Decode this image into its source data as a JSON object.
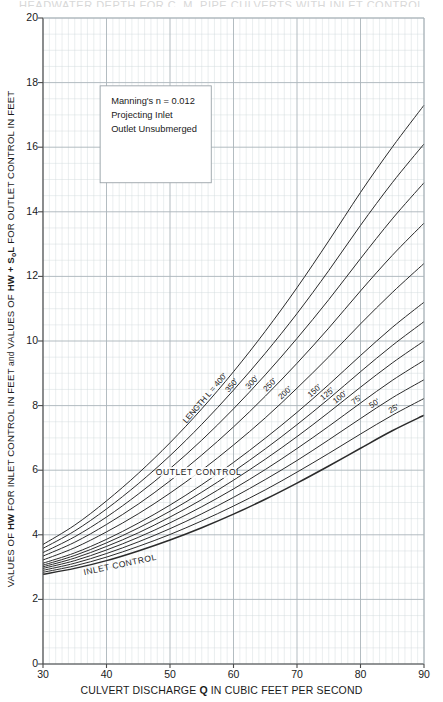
{
  "title_cut_off": "HEADWATER DEPTH FOR C. M. PIPE CULVERTS WITH INLET CONTROL",
  "axes": {
    "x_label_prefix": "CULVERT DISCHARGE ",
    "x_label_symbol": "Q",
    "x_label_suffix": " IN CUBIC FEET PER SECOND",
    "y_label_part1": "VALUES OF ",
    "y_label_hw1": "HW",
    "y_label_part2": " FOR INLET CONTROL IN FEET ",
    "y_label_and": "and",
    "y_label_part3": " VALUES OF ",
    "y_label_hw2": "HW",
    "y_label_plus": " + S",
    "y_label_sub": "o",
    "y_label_L": "L",
    "y_label_part4": " FOR OUTLET CONTROL IN FEET",
    "x_ticks": [
      30,
      40,
      50,
      60,
      70,
      80,
      90
    ],
    "y_ticks": [
      0,
      2,
      4,
      6,
      8,
      10,
      12,
      14,
      16,
      18,
      20
    ],
    "xlim": [
      30,
      90
    ],
    "ylim": [
      0,
      20
    ],
    "grid": "minor-and-major"
  },
  "legend_box": {
    "line1": "Manning's n = 0.012",
    "line2": "Projecting Inlet",
    "line3": "Outlet Unsubmerged"
  },
  "annotations": {
    "outlet_control": "OUTLET CONTROL",
    "inlet_control": "INLET CONTROL",
    "length_prefix": "LENGTH L = 400'"
  },
  "colors": {
    "curve": "#2b2b2b",
    "grid_minor": "#cfd8dc",
    "grid_major": "#aab4ba",
    "axis": "#4a4a4a",
    "text": "#1a1a1a",
    "box_border": "#9aa3a8"
  },
  "chart_data": {
    "type": "line",
    "title": "HEADWATER DEPTH FOR C. M. PIPE CULVERTS WITH INLET CONTROL",
    "xlabel": "CULVERT DISCHARGE Q IN CUBIC FEET PER SECOND",
    "ylabel": "VALUES OF HW FOR INLET CONTROL IN FEET and VALUES OF HW + SoL FOR OUTLET CONTROL IN FEET",
    "xlim": [
      30,
      90
    ],
    "ylim": [
      0,
      20
    ],
    "xticks": [
      30,
      40,
      50,
      60,
      70,
      80,
      90
    ],
    "yticks": [
      0,
      2,
      4,
      6,
      8,
      10,
      12,
      14,
      16,
      18,
      20
    ],
    "grid": true,
    "legend_position": "inline-curve-labels",
    "x": [
      30,
      35,
      40,
      45,
      50,
      55,
      60,
      65,
      70,
      75,
      80,
      85,
      90
    ],
    "series": [
      {
        "name": "LENGTH L = 400'",
        "label": "LENGTH L = 400'",
        "values": [
          3.7,
          4.3,
          5.05,
          5.9,
          6.85,
          7.9,
          9.05,
          10.3,
          11.65,
          13.1,
          14.6,
          16.0,
          17.3
        ]
      },
      {
        "name": "350'",
        "label": "350'",
        "values": [
          3.58,
          4.12,
          4.8,
          5.58,
          6.45,
          7.42,
          8.48,
          9.62,
          10.85,
          12.18,
          13.58,
          14.9,
          16.1
        ]
      },
      {
        "name": "300'",
        "label": "300'",
        "values": [
          3.45,
          3.94,
          4.55,
          5.26,
          6.05,
          6.93,
          7.9,
          8.95,
          10.08,
          11.28,
          12.55,
          13.78,
          14.9
        ]
      },
      {
        "name": "250'",
        "label": "250'",
        "values": [
          3.34,
          3.77,
          4.32,
          4.95,
          5.67,
          6.47,
          7.34,
          8.29,
          9.31,
          10.4,
          11.55,
          12.65,
          13.65
        ]
      },
      {
        "name": "200'",
        "label": "200'",
        "values": [
          3.22,
          3.6,
          4.09,
          4.65,
          5.29,
          6.0,
          6.78,
          7.62,
          8.54,
          9.51,
          10.53,
          11.5,
          12.4
        ]
      },
      {
        "name": "150'",
        "label": "150'",
        "values": [
          3.12,
          3.44,
          3.86,
          4.36,
          4.92,
          5.55,
          6.24,
          6.99,
          7.79,
          8.65,
          9.55,
          10.42,
          11.2
        ]
      },
      {
        "name": "125'",
        "label": "125'",
        "values": [
          3.06,
          3.36,
          3.75,
          4.21,
          4.73,
          5.32,
          5.96,
          6.66,
          7.41,
          8.21,
          9.05,
          9.86,
          10.6
        ]
      },
      {
        "name": "100'",
        "label": "100'",
        "values": [
          3.01,
          3.28,
          3.64,
          4.06,
          4.55,
          5.09,
          5.69,
          6.34,
          7.04,
          7.79,
          8.57,
          9.32,
          10.0
        ]
      },
      {
        "name": "75'",
        "label": "75'",
        "values": [
          2.96,
          3.2,
          3.53,
          3.92,
          4.37,
          4.87,
          5.42,
          6.02,
          6.67,
          7.36,
          8.08,
          8.78,
          9.4
        ]
      },
      {
        "name": "50'",
        "label": "50'",
        "values": [
          2.9,
          3.12,
          3.42,
          3.78,
          4.19,
          4.65,
          5.16,
          5.71,
          6.3,
          6.94,
          7.6,
          8.24,
          8.8
        ]
      },
      {
        "name": "25'",
        "label": "25'",
        "values": [
          2.84,
          3.04,
          3.31,
          3.64,
          4.01,
          4.43,
          4.89,
          5.39,
          5.94,
          6.52,
          7.12,
          7.7,
          8.22
        ]
      },
      {
        "name": "INLET CONTROL",
        "label": "INLET CONTROL",
        "values": [
          2.78,
          2.96,
          3.2,
          3.5,
          3.84,
          4.22,
          4.64,
          5.1,
          5.6,
          6.13,
          6.68,
          7.22,
          7.7
        ]
      }
    ],
    "annotations": [
      {
        "text": "OUTLET CONTROL",
        "x": 54.5,
        "y": 5.85
      },
      {
        "text": "INLET CONTROL",
        "x": 36.5,
        "y": 2.75
      },
      {
        "text": "Manning's n = 0.012",
        "x": 40.5,
        "y": 17.1
      },
      {
        "text": "Projecting Inlet",
        "x": 40.5,
        "y": 16.3
      },
      {
        "text": "Outlet Unsubmerged",
        "x": 40.5,
        "y": 15.5
      }
    ]
  }
}
